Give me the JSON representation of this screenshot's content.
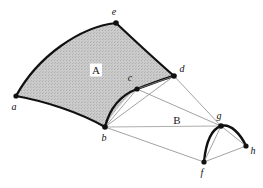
{
  "figure": {
    "width": 263,
    "height": 188,
    "background": "#ffffff",
    "colors": {
      "patch_a_fill": "#c9c9c9",
      "thick_stroke": "#111111",
      "thin_stroke": "#8a8a8a",
      "vertex_dot": "#111111",
      "label_text": "#111111"
    },
    "vertices": [
      {
        "id": "a",
        "label": "a",
        "x": 16,
        "y": 96,
        "label_x": 14,
        "label_y": 107
      },
      {
        "id": "b",
        "label": "b",
        "x": 105,
        "y": 127,
        "label_x": 104,
        "label_y": 138
      },
      {
        "id": "c",
        "label": "c",
        "x": 137,
        "y": 89,
        "label_x": 130,
        "label_y": 78
      },
      {
        "id": "d",
        "label": "d",
        "x": 174,
        "y": 76,
        "label_x": 182,
        "label_y": 69
      },
      {
        "id": "e",
        "label": "e",
        "x": 116,
        "y": 23,
        "label_x": 114,
        "label_y": 12
      },
      {
        "id": "f",
        "label": "f",
        "x": 204,
        "y": 162,
        "label_x": 202,
        "label_y": 173
      },
      {
        "id": "g",
        "label": "g",
        "x": 221,
        "y": 126,
        "label_x": 219,
        "label_y": 116
      },
      {
        "id": "h",
        "label": "h",
        "x": 246,
        "y": 146,
        "label_x": 253,
        "label_y": 151
      }
    ],
    "regions": [
      {
        "id": "A",
        "label": "A",
        "x": 96,
        "y": 70,
        "boxed": true
      },
      {
        "id": "B",
        "label": "B",
        "x": 177,
        "y": 120,
        "boxed": false
      }
    ]
  }
}
